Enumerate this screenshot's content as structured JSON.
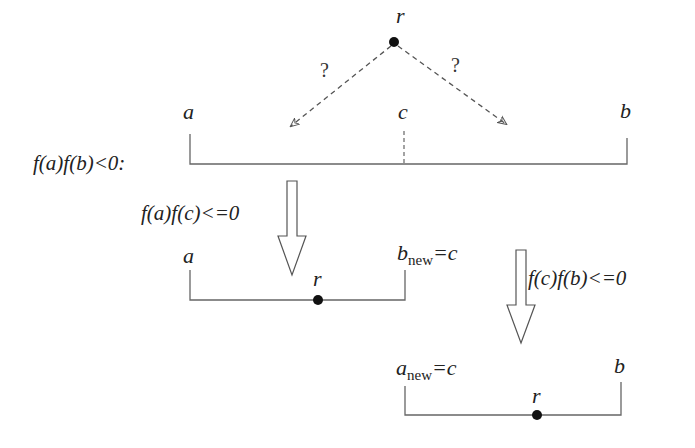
{
  "diagram": {
    "colors": {
      "line": "#555555",
      "dot": "#111111",
      "text": "#222222",
      "dashed": "#555555"
    },
    "top": {
      "root_label": "r",
      "question_left": "?",
      "question_right": "?"
    },
    "step0": {
      "condition": "f(a)f(b)<0:",
      "label_a": "a",
      "label_c": "c",
      "label_b": "b"
    },
    "step1": {
      "condition": "f(a)f(c)<=0",
      "label_a": "a",
      "label_root": "r",
      "label_b_main": "b",
      "label_b_sub": "new",
      "label_b_eq": "=c"
    },
    "step2": {
      "condition": "f(c)f(b)<=0",
      "label_a_main": "a",
      "label_a_sub": "new",
      "label_a_eq": "=c",
      "label_root": "r",
      "label_b": "b"
    }
  }
}
